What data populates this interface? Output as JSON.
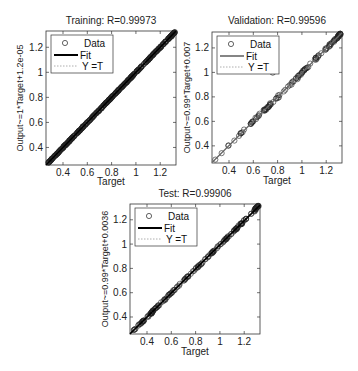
{
  "chart_data": [
    {
      "type": "scatter",
      "title": "Training: R=0.99973",
      "xlabel": "Target",
      "ylabel": "Output~=1*Target+1.2e-05",
      "xlim": [
        0.26,
        1.33
      ],
      "ylim": [
        0.26,
        1.33
      ],
      "xticks": [
        "0.4",
        "0.6",
        "0.8",
        "1",
        "1.2"
      ],
      "yticks": [
        "0.4",
        "0.6",
        "0.8",
        "1",
        "1.2"
      ],
      "legend": [
        "Data",
        "Fit",
        "Y = T"
      ],
      "legend_position": "upper left",
      "fit": {
        "slope": 1,
        "intercept": 1.2e-05
      },
      "R": 0.99973,
      "series": [
        {
          "name": "Data",
          "points": "dense points along Y=T from 0.26 to 1.33"
        }
      ]
    },
    {
      "type": "scatter",
      "title": "Validation: R=0.99596",
      "xlabel": "Target",
      "ylabel": "Output~=0.99*Target+0.007",
      "xlim": [
        0.26,
        1.33
      ],
      "ylim": [
        0.26,
        1.33
      ],
      "xticks": [
        "0.4",
        "0.6",
        "0.8",
        "1",
        "1.2"
      ],
      "yticks": [
        "0.4",
        "0.6",
        "0.8",
        "1",
        "1.2"
      ],
      "legend": [
        "Data",
        "Fit",
        "Y = T"
      ],
      "legend_position": "upper left",
      "fit": {
        "slope": 0.99,
        "intercept": 0.007
      },
      "R": 0.99596,
      "outliers": [
        {
          "x": 0.76,
          "y": 1.0
        }
      ]
    },
    {
      "type": "scatter",
      "title": "Test: R=0.99906",
      "xlabel": "Target",
      "ylabel": "Output~=0.99*Target+0.0036",
      "xlim": [
        0.26,
        1.33
      ],
      "ylim": [
        0.26,
        1.33
      ],
      "xticks": [
        "0.4",
        "0.6",
        "0.8",
        "1",
        "1.2"
      ],
      "yticks": [
        "0.4",
        "0.6",
        "0.8",
        "1",
        "1.2"
      ],
      "legend": [
        "Data",
        "Fit",
        "Y = T"
      ],
      "legend_position": "upper left",
      "fit": {
        "slope": 0.99,
        "intercept": 0.0036
      },
      "R": 0.99906
    }
  ],
  "panels": {
    "training": {
      "title": "Training: R=0.99973",
      "xlabel": "Target",
      "ylabel": "Output~=1*Target+1.2e-05"
    },
    "validation": {
      "title": "Validation: R=0.99596",
      "xlabel": "Target",
      "ylabel": "Output~=0.99*Target+0.007"
    },
    "test": {
      "title": "Test: R=0.99906",
      "xlabel": "Target",
      "ylabel": "Output~=0.99*Target+0.0036"
    }
  },
  "legend": {
    "data": "Data",
    "fit": "Fit",
    "yt": "Y =T"
  },
  "ticks": [
    "0.4",
    "0.6",
    "0.8",
    "1",
    "1.2"
  ]
}
